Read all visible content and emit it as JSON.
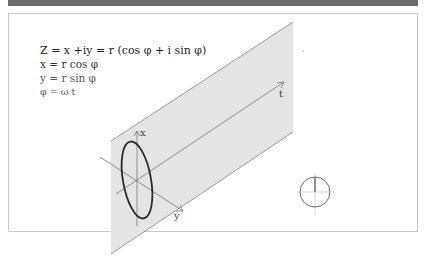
{
  "header": {
    "title": ""
  },
  "equations": {
    "complex": "Z = x +iy = r (cos φ + i sin φ)",
    "x": "x = r cos φ",
    "y": "y = r sin φ",
    "phase": "φ = ω t"
  },
  "axes": {
    "x_label": "x",
    "y_label": "y",
    "t_label": "t"
  },
  "colors": {
    "plane_fill": "#e4e4e4",
    "plane_edge": "#9a9a9a",
    "ellipse": "#2a2a2a",
    "axis": "#777777",
    "header_bar": "#6b6b6b"
  }
}
